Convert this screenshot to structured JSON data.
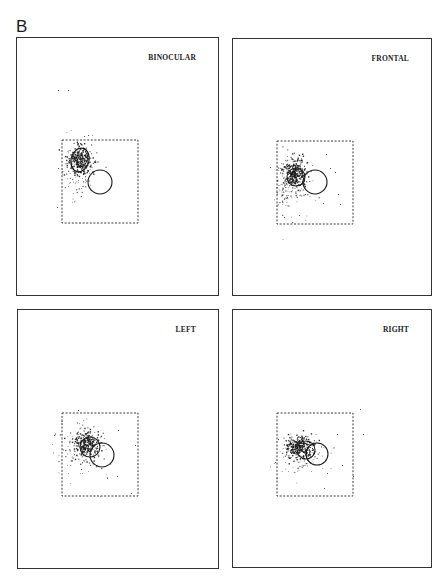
{
  "figure": {
    "label": "B"
  },
  "chart_data": [
    {
      "type": "scatter",
      "title": "BINOCULAR",
      "panel_box": [
        16,
        37,
        219,
        296
      ],
      "dashed_box": [
        62,
        140,
        138,
        223
      ],
      "circles": [
        {
          "role": "reference",
          "cx": 100,
          "cy": 182,
          "r": 12
        }
      ],
      "ellipses": [
        {
          "role": "fixation-contour",
          "cx": 80,
          "cy": 160,
          "rx": 9,
          "ry": 12,
          "rotate": 15
        }
      ],
      "clusters": [
        {
          "cx": 79,
          "cy": 160,
          "sx": 6,
          "sy": 7,
          "n": 260,
          "dense": true
        },
        {
          "cx": 76,
          "cy": 172,
          "sx": 9,
          "sy": 14,
          "n": 90,
          "dense": false
        }
      ],
      "stray_points": [
        [
          58,
          90
        ],
        [
          68,
          90
        ],
        [
          57,
          207
        ],
        [
          84,
          136
        ],
        [
          88,
          135
        ]
      ],
      "xlabel": "",
      "ylabel": "",
      "grid": false
    },
    {
      "type": "scatter",
      "title": "FRONTAL",
      "panel_box": [
        232,
        38,
        432,
        296
      ],
      "dashed_box": [
        277,
        141,
        353,
        224
      ],
      "circles": [
        {
          "role": "reference",
          "cx": 315,
          "cy": 182,
          "r": 12
        },
        {
          "role": "fixation-contour",
          "cx": 296,
          "cy": 177,
          "r": 9
        }
      ],
      "ellipses": [],
      "clusters": [
        {
          "cx": 294,
          "cy": 173,
          "sx": 6,
          "sy": 7,
          "n": 280,
          "dense": true
        },
        {
          "cx": 283,
          "cy": 185,
          "sx": 4,
          "sy": 12,
          "n": 70,
          "dense": false
        },
        {
          "cx": 298,
          "cy": 190,
          "sx": 10,
          "sy": 14,
          "n": 60,
          "dense": false
        }
      ],
      "stray_points": [
        [
          326,
          154
        ],
        [
          335,
          172
        ],
        [
          338,
          194
        ],
        [
          340,
          204
        ],
        [
          323,
          203
        ],
        [
          284,
          217
        ],
        [
          299,
          215
        ],
        [
          330,
          168
        ]
      ],
      "xlabel": "",
      "ylabel": "",
      "grid": false
    },
    {
      "type": "scatter",
      "title": "LEFT",
      "panel_box": [
        17,
        309,
        219,
        569
      ],
      "dashed_box": [
        62,
        413,
        138,
        496
      ],
      "circles": [
        {
          "role": "reference",
          "cx": 102,
          "cy": 455,
          "r": 12
        },
        {
          "role": "fixation-contour",
          "cx": 90,
          "cy": 447,
          "r": 10
        }
      ],
      "ellipses": [],
      "clusters": [
        {
          "cx": 86,
          "cy": 443,
          "sx": 7,
          "sy": 7,
          "n": 230,
          "dense": true
        },
        {
          "cx": 84,
          "cy": 452,
          "sx": 12,
          "sy": 13,
          "n": 110,
          "dense": false
        }
      ],
      "stray_points": [
        [
          78,
          410
        ],
        [
          118,
          430
        ],
        [
          135,
          445
        ],
        [
          117,
          476
        ],
        [
          107,
          478
        ],
        [
          131,
          493
        ]
      ],
      "xlabel": "",
      "ylabel": "",
      "grid": false
    },
    {
      "type": "scatter",
      "title": "RIGHT",
      "panel_box": [
        232,
        309,
        432,
        568
      ],
      "dashed_box": [
        277,
        413,
        353,
        496
      ],
      "circles": [
        {
          "role": "reference",
          "cx": 317,
          "cy": 454,
          "r": 11
        },
        {
          "role": "fixation-contour",
          "cx": 306,
          "cy": 450,
          "r": 9
        }
      ],
      "ellipses": [],
      "clusters": [
        {
          "cx": 299,
          "cy": 446,
          "sx": 7,
          "sy": 6,
          "n": 270,
          "dense": true
        },
        {
          "cx": 302,
          "cy": 455,
          "sx": 12,
          "sy": 11,
          "n": 100,
          "dense": false
        }
      ],
      "stray_points": [
        [
          360,
          409
        ],
        [
          363,
          434
        ],
        [
          337,
          434
        ],
        [
          342,
          465
        ],
        [
          327,
          473
        ],
        [
          324,
          488
        ],
        [
          353,
          476
        ],
        [
          275,
          462
        ]
      ],
      "xlabel": "",
      "ylabel": "",
      "grid": false
    }
  ],
  "style": {
    "ink": "#1a1a1a",
    "frame": "#333333",
    "dash": "#3a3a3a",
    "background": "#ffffff"
  }
}
